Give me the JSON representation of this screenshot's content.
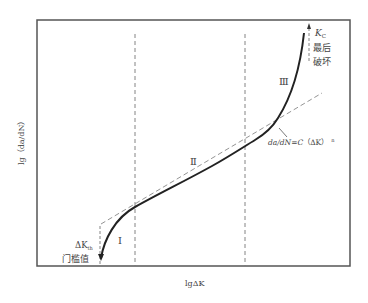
{
  "diagram": {
    "y_axis_label": "lg（da/dN）",
    "x_axis_label": "lgΔK",
    "regions": [
      {
        "id": "I",
        "label": "Ⅰ"
      },
      {
        "id": "II",
        "label": "Ⅱ"
      },
      {
        "id": "III",
        "label": "Ⅲ"
      }
    ],
    "threshold": {
      "symbol": "ΔK",
      "subscript": "th",
      "caption": "门槛值"
    },
    "critical": {
      "symbol": "K",
      "subscript": "C",
      "caption_line1": "最后",
      "caption_line2": "破坏"
    },
    "paris_law": {
      "lhs": "da/dN=C",
      "rhs": "（ΔK）",
      "exponent": "n"
    },
    "colors": {
      "curve": "#222222",
      "frame": "#555555",
      "dashed": "#777777",
      "text": "#444444"
    }
  }
}
